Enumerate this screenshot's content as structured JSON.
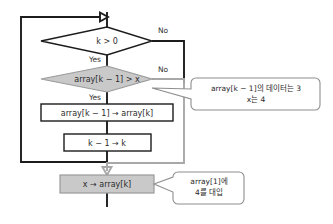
{
  "diagram": {
    "colors": {
      "line_black": "#1c1c1c",
      "line_gray": "#a8a8a8",
      "fill_gray": "#c9c9c9",
      "fill_white": "#ffffff",
      "stroke_gray": "#9a9a9a",
      "text": "#2b2b2b"
    },
    "nodes": {
      "decision_k": {
        "label": "k > 0",
        "shape": "diamond",
        "fill": "white"
      },
      "decision_compare": {
        "label": "array[k − 1] > x",
        "shape": "diamond",
        "fill": "gray"
      },
      "process_shift": {
        "label": "array[k − 1] → array[k]",
        "shape": "rectangle",
        "fill": "white"
      },
      "process_decrement": {
        "label": "k − 1 → k",
        "shape": "rectangle",
        "fill": "white"
      },
      "process_assign": {
        "label": "x → array[k]",
        "shape": "rectangle",
        "fill": "gray"
      }
    },
    "branch_labels": {
      "k_no": "No",
      "k_yes": "Yes",
      "compare_no": "No",
      "compare_yes": "Yes"
    },
    "callouts": {
      "compare_note": {
        "line1": "array[k − 1]의 데이터는 3",
        "line2": "x는 4"
      },
      "assign_note": {
        "line1": "array[1]에",
        "line2": "4를 대입"
      }
    }
  }
}
